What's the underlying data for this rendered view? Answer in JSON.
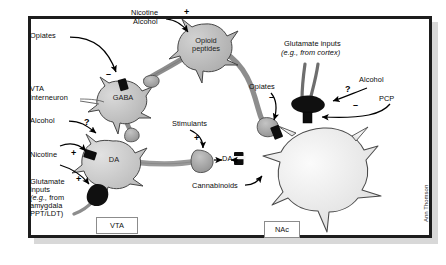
{
  "figure": {
    "credit": "Ann Thomson",
    "frame_color": "#1d1d1d",
    "background": "#ffffff"
  },
  "regions": [
    {
      "id": "vta",
      "label": "VTA",
      "x": 96,
      "y": 217,
      "w": 40,
      "h": 15
    },
    {
      "id": "nac",
      "label": "NAc",
      "x": 264,
      "y": 221,
      "w": 34,
      "h": 15
    }
  ],
  "cells": [
    {
      "id": "opioid-peptides",
      "label": "Opioid\npeptides",
      "label_line1": "Opioid",
      "label_line2": "peptides",
      "cx": 205,
      "cy": 44,
      "r": 20,
      "fill": "#b4b4b4"
    },
    {
      "id": "gaba-interneuron",
      "label": "GABA",
      "cx": 122,
      "cy": 98,
      "r": 17,
      "fill": "#bdbdbd"
    },
    {
      "id": "da-neuron",
      "label": "DA",
      "cx": 113,
      "cy": 160,
      "r": 19,
      "fill": "#c6c6c6"
    },
    {
      "id": "nac-neuron",
      "label": "",
      "cx": 323,
      "cy": 166,
      "r": 37,
      "fill": "#ececec"
    }
  ],
  "labels": [
    {
      "id": "opiates-vta",
      "text": "Opiates",
      "x": 30,
      "y": 36
    },
    {
      "id": "nicotine-top",
      "text": "Nicotine",
      "x": 131,
      "y": 13
    },
    {
      "id": "alcohol-top",
      "text": "Alcohol",
      "x": 133,
      "y": 22
    },
    {
      "id": "vta-interneuron-1",
      "text": "VTA",
      "x": 30,
      "y": 89
    },
    {
      "id": "vta-interneuron-2",
      "text": "interneuron",
      "x": 30,
      "y": 98
    },
    {
      "id": "alcohol-left",
      "text": "Alcohol",
      "x": 30,
      "y": 121
    },
    {
      "id": "nicotine-left",
      "text": "Nicotine",
      "x": 30,
      "y": 155
    },
    {
      "id": "glutamate-left-1",
      "text": "Glutamate",
      "x": 30,
      "y": 182
    },
    {
      "id": "glutamate-left-2",
      "text": "inputs",
      "x": 30,
      "y": 190
    },
    {
      "id": "glutamate-left-3a",
      "text": "(e.g., ",
      "x": 30,
      "y": 198
    },
    {
      "id": "glutamate-left-3b",
      "text": "from",
      "x": 30,
      "y": 198
    },
    {
      "id": "glutamate-left-4",
      "text": "amygdala",
      "x": 30,
      "y": 206
    },
    {
      "id": "glutamate-left-5",
      "text": "PPT/LDT)",
      "x": 30,
      "y": 214
    },
    {
      "id": "stimulants",
      "text": "Stimulants",
      "x": 172,
      "y": 124
    },
    {
      "id": "da-synapse",
      "text": "DA",
      "x": 225,
      "y": 158
    },
    {
      "id": "cannabinoids",
      "text": "Cannabinoids",
      "x": 196,
      "y": 186
    },
    {
      "id": "opiates-nac",
      "text": "Opiates",
      "x": 251,
      "y": 87
    },
    {
      "id": "glutamate-cortex-1",
      "text": "Glutamate inputs",
      "x": 288,
      "y": 44
    },
    {
      "id": "glutamate-cortex-2",
      "text": "(e.g., from cortex)",
      "x": 283,
      "y": 53
    },
    {
      "id": "alcohol-right",
      "text": "Alcohol",
      "x": 362,
      "y": 80
    },
    {
      "id": "pcp",
      "text": "PCP",
      "x": 382,
      "y": 99
    }
  ],
  "signs": [
    {
      "id": "minus-opiates-vta",
      "text": "–",
      "x": 108,
      "y": 78
    },
    {
      "id": "plus-nicotine-alcohol",
      "text": "+",
      "x": 186,
      "y": 14
    },
    {
      "id": "question-alcohol-vta",
      "text": "?",
      "x": 86,
      "y": 123
    },
    {
      "id": "plus-nicotine-da",
      "text": "+",
      "x": 73,
      "y": 153
    },
    {
      "id": "plus-glutamate-vta",
      "text": "+",
      "x": 78,
      "y": 179
    },
    {
      "id": "plus-stimulants",
      "text": "+",
      "x": 196,
      "y": 140
    },
    {
      "id": "minus-opiates-nac",
      "text": "–",
      "x": 271,
      "y": 99
    },
    {
      "id": "question-alcohol-nac",
      "text": "?",
      "x": 347,
      "y": 90
    },
    {
      "id": "minus-pcp",
      "text": "–",
      "x": 355,
      "y": 108
    }
  ],
  "colors": {
    "cell_dark": "#b4b4b4",
    "cell_mid": "#c6c6c6",
    "cell_light": "#ececec",
    "receptor": "#0d0d0d",
    "terminal": "#9a9a9a",
    "outline": "#3a3a3a",
    "arrow": "#000000"
  }
}
